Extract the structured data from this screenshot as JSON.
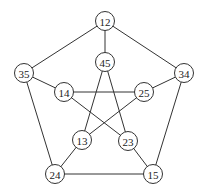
{
  "diagram": {
    "type": "graph",
    "name": "Petersen graph",
    "node_radius": 9.5,
    "nodes": [
      {
        "id": "12",
        "label": "12",
        "x": 105,
        "y": 21
      },
      {
        "id": "35",
        "label": "35",
        "x": 24,
        "y": 73
      },
      {
        "id": "34",
        "label": "34",
        "x": 184,
        "y": 73
      },
      {
        "id": "24",
        "label": "24",
        "x": 55,
        "y": 174
      },
      {
        "id": "15",
        "label": "15",
        "x": 153,
        "y": 174
      },
      {
        "id": "45",
        "label": "45",
        "x": 105,
        "y": 62
      },
      {
        "id": "14",
        "label": "14",
        "x": 64,
        "y": 92
      },
      {
        "id": "25",
        "label": "25",
        "x": 144,
        "y": 92
      },
      {
        "id": "13",
        "label": "13",
        "x": 82,
        "y": 140
      },
      {
        "id": "23",
        "label": "23",
        "x": 128,
        "y": 141
      }
    ],
    "edges": [
      [
        "12",
        "35"
      ],
      [
        "12",
        "34"
      ],
      [
        "35",
        "24"
      ],
      [
        "34",
        "15"
      ],
      [
        "24",
        "15"
      ],
      [
        "12",
        "45"
      ],
      [
        "35",
        "14"
      ],
      [
        "34",
        "25"
      ],
      [
        "24",
        "13"
      ],
      [
        "15",
        "23"
      ],
      [
        "45",
        "13"
      ],
      [
        "45",
        "23"
      ],
      [
        "14",
        "25"
      ],
      [
        "14",
        "23"
      ],
      [
        "25",
        "13"
      ]
    ],
    "colors": {
      "stroke": "#333333",
      "fill": "#ffffff",
      "text": "#222222"
    }
  }
}
